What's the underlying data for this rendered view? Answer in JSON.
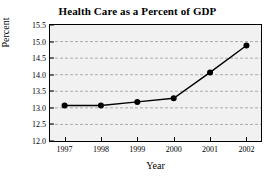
{
  "chart_data": {
    "type": "line",
    "title": "Health Care as a Percent of GDP",
    "xlabel": "Year",
    "ylabel": "Percent",
    "categories": [
      "1997",
      "1998",
      "1999",
      "2000",
      "2001",
      "2002"
    ],
    "x": [
      1997,
      1998,
      1999,
      2000,
      2001,
      2002
    ],
    "values": [
      13.07,
      13.07,
      13.18,
      13.29,
      14.07,
      14.88
    ],
    "series": [
      {
        "name": "Health care percent of GDP",
        "values": [
          13.07,
          13.07,
          13.18,
          13.29,
          14.07,
          14.88
        ]
      }
    ],
    "ylim": [
      12.0,
      15.5
    ],
    "xlim": [
      1996.6,
      2002.4
    ],
    "ytick_labels": [
      "12.0",
      "12.5",
      "13.0",
      "13.5",
      "14.0",
      "14.5",
      "15.0",
      "15.5"
    ],
    "ytick_values": [
      12.0,
      12.5,
      13.0,
      13.5,
      14.0,
      14.5,
      15.0,
      15.5
    ],
    "xtick_labels": [
      "1997",
      "1998",
      "1999",
      "2000",
      "2001",
      "2002"
    ],
    "xtick_values": [
      1997,
      1998,
      1999,
      2000,
      2001,
      2002
    ],
    "grid": true,
    "grid_axis": "y",
    "grid_style": "dashed",
    "legend": false,
    "marker": "circle",
    "line_color": "#000000",
    "marker_color": "#000000",
    "grid_color": "#9a9a9a",
    "plot_background": "#f1f1f1",
    "figure_background": "#ffffff",
    "axis_color": "#000000"
  }
}
